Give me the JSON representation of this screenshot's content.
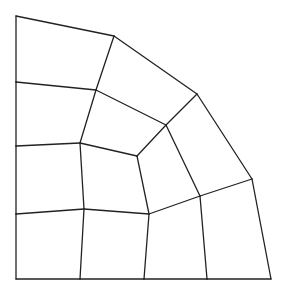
{
  "diagram": {
    "type": "quadrilateral-mesh",
    "stroke_color": "#222222",
    "background": "#ffffff",
    "nodes": {
      "A0": [
        16,
        279
      ],
      "A1": [
        16,
        214
      ],
      "A2": [
        16,
        146
      ],
      "A3": [
        16,
        82
      ],
      "A4": [
        16,
        16
      ],
      "B0": [
        80,
        279
      ],
      "B1": [
        84,
        209
      ],
      "B2": [
        80,
        143
      ],
      "B3": [
        96,
        90
      ],
      "B4": [
        114,
        36
      ],
      "C0": [
        144,
        279
      ],
      "C1": [
        149,
        214
      ],
      "C2": [
        137,
        156
      ],
      "C3": [
        166,
        125
      ],
      "C4": [
        197,
        94
      ],
      "D0": [
        207,
        279
      ],
      "D1": [
        200,
        196
      ],
      "D2": [
        252,
        179
      ],
      "E0": [
        271,
        279
      ]
    },
    "edges": [
      [
        "A0",
        "A1"
      ],
      [
        "A1",
        "A2"
      ],
      [
        "A2",
        "A3"
      ],
      [
        "A3",
        "A4"
      ],
      [
        "A4",
        "B4"
      ],
      [
        "B4",
        "C4"
      ],
      [
        "C4",
        "D2"
      ],
      [
        "D2",
        "E0"
      ],
      [
        "A0",
        "B0"
      ],
      [
        "B0",
        "C0"
      ],
      [
        "C0",
        "D0"
      ],
      [
        "D0",
        "E0"
      ],
      [
        "B0",
        "B1"
      ],
      [
        "B1",
        "B2"
      ],
      [
        "B2",
        "B3"
      ],
      [
        "B3",
        "B4"
      ],
      [
        "C0",
        "C1"
      ],
      [
        "C1",
        "C2"
      ],
      [
        "C2",
        "C3"
      ],
      [
        "C3",
        "C4"
      ],
      [
        "D0",
        "D1"
      ],
      [
        "D1",
        "D2"
      ],
      [
        "A1",
        "B1"
      ],
      [
        "B1",
        "C1"
      ],
      [
        "C1",
        "D1"
      ],
      [
        "A2",
        "B2"
      ],
      [
        "B2",
        "C2"
      ],
      [
        "A3",
        "B3"
      ],
      [
        "B3",
        "C3"
      ],
      [
        "C3",
        "D1"
      ]
    ]
  }
}
